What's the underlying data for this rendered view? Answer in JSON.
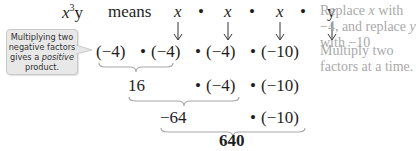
{
  "expression": {
    "base": "x",
    "exponent": "3",
    "var2": "y",
    "means_label": "means",
    "factors": [
      "x",
      "x",
      "x",
      "y"
    ],
    "dot": "•"
  },
  "substitution_row": {
    "factors": [
      "(−4)",
      "(−4)",
      "(−4)",
      "(−10)"
    ]
  },
  "step2": {
    "product": "16",
    "remaining": [
      "(−4)",
      "(−10)"
    ]
  },
  "step3": {
    "product": "−64",
    "remaining": [
      "(−10)"
    ]
  },
  "result": "640",
  "callout": {
    "line1": "Multiplying two",
    "line2": "negative factors",
    "line3_prefix": "gives a ",
    "line3_emph": "positive",
    "line4": "product."
  },
  "notes": {
    "replace_a": "Replace ",
    "replace_x": "x",
    "replace_b": " with −4, and replace ",
    "replace_y": "y",
    "replace_c": " with −10",
    "multiply": "Multiply two factors at a time."
  },
  "colors": {
    "callout_bg": "#e8e8e8",
    "note_text": "#a9a9a9",
    "brace": "#a8a8a8"
  }
}
